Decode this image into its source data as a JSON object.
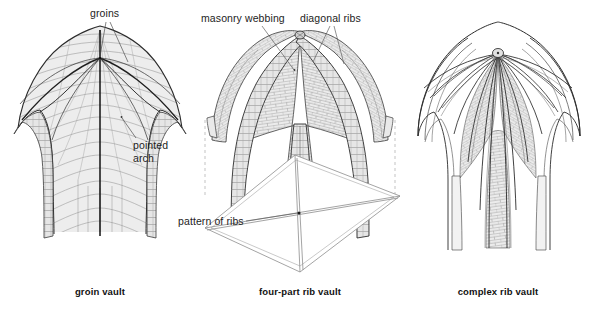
{
  "figure": {
    "background": "#ffffff",
    "ink": "#1d1d1d",
    "masonry_fill": "#e9e9e9",
    "webbing_fill": "#ededed",
    "plan_line": "#8d8d8d",
    "dashed_line": "#b6b6b6"
  },
  "panels": [
    {
      "id": "groin-vault",
      "caption": "groin vault",
      "caption_x": 100,
      "labels": [
        {
          "name": "groins",
          "text": "groins",
          "x": 90,
          "y": 8,
          "lines": [
            "groins"
          ]
        },
        {
          "name": "pointed-arch",
          "text": "pointed arch",
          "x": 133,
          "y": 140,
          "lines": [
            "pointed",
            "arch"
          ]
        }
      ]
    },
    {
      "id": "four-part-rib-vault",
      "caption": "four-part rib vault",
      "caption_x": 300,
      "labels": [
        {
          "name": "masonry-webbing",
          "text": "masonry webbing",
          "x": 201,
          "y": 13,
          "lines": [
            "masonry webbing"
          ]
        },
        {
          "name": "diagonal-ribs",
          "text": "diagonal ribs",
          "x": 300,
          "y": 13,
          "lines": [
            "diagonal ribs"
          ]
        },
        {
          "name": "pattern-of-ribs",
          "text": "pattern of ribs",
          "x": 178,
          "y": 215,
          "lines": [
            "pattern of ribs"
          ]
        }
      ]
    },
    {
      "id": "complex-rib-vault",
      "caption": "complex rib vault",
      "caption_x": 498,
      "labels": []
    }
  ],
  "captions": {
    "groin": "groin vault",
    "four_part": "four-part rib vault",
    "complex": "complex rib vault"
  },
  "label_text": {
    "groins": "groins",
    "pointed_arch_line1": "pointed",
    "pointed_arch_line2": "arch",
    "masonry_webbing": "masonry webbing",
    "diagonal_ribs": "diagonal ribs",
    "pattern_of_ribs": "pattern of ribs"
  }
}
